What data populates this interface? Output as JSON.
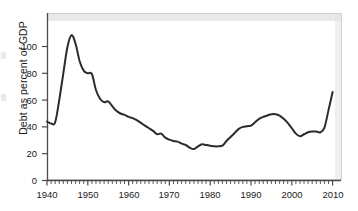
{
  "figure": {
    "background_color": "#ffffff",
    "line_color": "#2b2b2b",
    "axis_color": "#4a4a4a",
    "frame_color": "#d0d0d0",
    "top_band_color": "#e2e2e2"
  },
  "chart_data": {
    "type": "line",
    "title": "",
    "subtitle": "",
    "xlabel": "",
    "ylabel": "Debt as percent of GDP",
    "xlim": [
      1939,
      2011
    ],
    "ylim": [
      0,
      112
    ],
    "grid": false,
    "legend": null,
    "x_ticks_major": [
      1940,
      1950,
      1960,
      1970,
      1980,
      1990,
      2000,
      2010
    ],
    "x_tick_labels": [
      "1940",
      "1950",
      "1960",
      "1970",
      "1980",
      "1990",
      "2000",
      "2010"
    ],
    "x_minor_tick_step": 1,
    "y_ticks": [
      0,
      20,
      40,
      60,
      80,
      100
    ],
    "y_tick_labels": [
      "0",
      "20",
      "40",
      "60",
      "80",
      "100"
    ],
    "series": [
      {
        "name": "Debt as percent of GDP",
        "x": [
          1940,
          1941,
          1942,
          1943,
          1944,
          1945,
          1946,
          1947,
          1948,
          1949,
          1950,
          1951,
          1952,
          1953,
          1954,
          1955,
          1956,
          1957,
          1958,
          1959,
          1960,
          1961,
          1962,
          1963,
          1964,
          1965,
          1966,
          1967,
          1968,
          1969,
          1970,
          1971,
          1972,
          1973,
          1974,
          1975,
          1976,
          1977,
          1978,
          1979,
          1980,
          1981,
          1982,
          1983,
          1984,
          1985,
          1986,
          1987,
          1988,
          1989,
          1990,
          1991,
          1992,
          1993,
          1994,
          1995,
          1996,
          1997,
          1998,
          1999,
          2000,
          2001,
          2002,
          2003,
          2004,
          2005,
          2006,
          2007,
          2008,
          2009,
          2010
        ],
        "values": [
          44,
          42.5,
          43.5,
          60,
          80,
          99.5,
          108.5,
          102,
          89,
          82,
          80,
          79.5,
          67.5,
          61,
          58.5,
          59,
          55.5,
          52,
          50,
          49,
          47.5,
          46.5,
          45,
          43,
          41,
          39,
          37,
          34.5,
          35,
          32,
          30.5,
          29.5,
          29,
          27.5,
          26.5,
          24.5,
          23.5,
          25.5,
          27,
          26.5,
          26,
          25.5,
          25.5,
          26,
          29.5,
          32.5,
          35.5,
          38.5,
          40,
          40.5,
          41,
          43.5,
          46,
          47.5,
          48.5,
          49.5,
          49.5,
          48.5,
          46,
          43,
          39,
          35,
          33,
          34.5,
          36,
          36.5,
          36.5,
          36,
          39.5,
          52.5,
          66
        ]
      }
    ]
  }
}
